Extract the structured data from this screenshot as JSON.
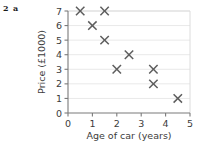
{
  "question": {
    "number": "2",
    "part": "a"
  },
  "chart_data": {
    "type": "scatter",
    "title": "",
    "xlabel": "Age of car (years)",
    "ylabel": "Price (£1000)",
    "xlim": [
      0,
      5
    ],
    "ylim": [
      0,
      7
    ],
    "xticks": [
      "0",
      "1",
      "2",
      "3",
      "4",
      "5"
    ],
    "yticks": [
      "0",
      "1",
      "2",
      "3",
      "4",
      "5",
      "6",
      "7"
    ],
    "grid": "horizontal",
    "legend": "none",
    "marker": "x",
    "marker_color": "#5d5d5d",
    "grid_color": "#e9e9e9",
    "axis_color": "#7a7a7a",
    "background": "#ffffff",
    "points": [
      {
        "x": 0.5,
        "y": 7
      },
      {
        "x": 1.0,
        "y": 6
      },
      {
        "x": 1.5,
        "y": 7
      },
      {
        "x": 1.5,
        "y": 5
      },
      {
        "x": 2.0,
        "y": 3
      },
      {
        "x": 2.5,
        "y": 4
      },
      {
        "x": 3.5,
        "y": 3
      },
      {
        "x": 3.5,
        "y": 2
      },
      {
        "x": 4.5,
        "y": 1
      }
    ]
  }
}
